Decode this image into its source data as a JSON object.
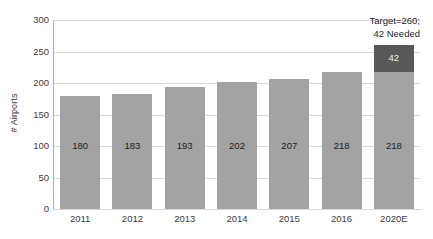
{
  "chart_data": {
    "type": "bar",
    "title": "",
    "subtitle": "",
    "xlabel": "",
    "ylabel": "# Airports",
    "ylim": [
      0,
      300
    ],
    "ytick_values": [
      0,
      50,
      100,
      150,
      200,
      250,
      300
    ],
    "ytick_labels": [
      "0",
      "50",
      "100",
      "150",
      "200",
      "250",
      "300"
    ],
    "grid": true,
    "legend": "none",
    "stacked": true,
    "categories": [
      "2011",
      "2012",
      "2013",
      "2014",
      "2015",
      "2016",
      "2020E"
    ],
    "series": [
      {
        "name": "Airports",
        "color": "#a3a3a3",
        "values": [
          180,
          183,
          193,
          202,
          207,
          218,
          218
        ],
        "labels": [
          "180",
          "183",
          "193",
          "202",
          "207",
          "218",
          "218"
        ]
      },
      {
        "name": "Needed",
        "color": "#585858",
        "values": [
          0,
          0,
          0,
          0,
          0,
          0,
          42
        ],
        "labels": [
          "",
          "",
          "",
          "",
          "",
          "",
          "42"
        ]
      }
    ],
    "annotations": [
      {
        "line1": "Target=260;",
        "line2": "42 Needed"
      }
    ]
  },
  "colors": {
    "bar_base": "#a3a3a3",
    "bar_needed": "#585858",
    "gridline": "#d9d9d9",
    "axis": "#b0b0b0",
    "text": "#404040",
    "background": "#ffffff"
  }
}
